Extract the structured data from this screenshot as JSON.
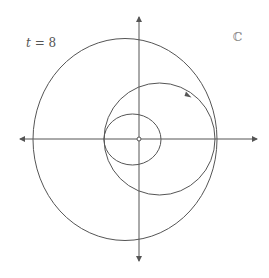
{
  "diagram": {
    "type": "complex-plane-curve",
    "time_label": {
      "variable": "t",
      "equals": " = ",
      "value": "8"
    },
    "plane_label": "ℂ",
    "colors": {
      "curve": "#555555",
      "axis": "#555555",
      "background": "#ffffff"
    },
    "axes": {
      "origin": [
        139,
        139
      ],
      "x": {
        "from": 20,
        "to": 257,
        "arrows": "both"
      },
      "y": {
        "from": 17,
        "to": 261,
        "arrows": "both"
      },
      "origin_marker": "open-circle"
    },
    "curves": [
      {
        "name": "inner-loop",
        "cx": 132.5,
        "cy": 139.5,
        "rx": 28.5,
        "ry": 25.5
      },
      {
        "name": "middle-loop",
        "cx": 159.5,
        "cy": 139,
        "rx": 55.5,
        "ry": 56,
        "direction": "counterclockwise"
      },
      {
        "name": "outer-loop",
        "cx": 125,
        "cy": 139.5,
        "rx": 92,
        "ry": 101
      }
    ],
    "direction_arrow": {
      "at": [
        188,
        95
      ],
      "direction": "counterclockwise"
    }
  }
}
